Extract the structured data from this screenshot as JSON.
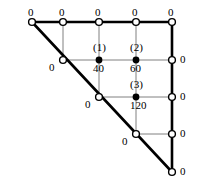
{
  "figure": {
    "width": 197,
    "height": 188,
    "background_color": "#ffffff",
    "line_color": "#000000",
    "interior_line_color": "#808080",
    "boundary_stroke_width": 2.6,
    "interior_stroke_width": 1.0,
    "grid_spacing": 35,
    "origin": {
      "x": 32,
      "y": 22
    }
  },
  "geometry": {
    "shape": "right-triangle",
    "vertices": [
      {
        "name": "top-left",
        "x": 32,
        "y": 22
      },
      {
        "name": "top-right",
        "x": 172,
        "y": 22
      },
      {
        "name": "bottom-right",
        "x": 172,
        "y": 172
      }
    ],
    "hypotenuse": {
      "from": "top-left",
      "to": "bottom-right"
    }
  },
  "boundary_nodes": {
    "top": [
      {
        "id": "T0",
        "x": 32,
        "y": 22,
        "value": "0",
        "label_dx": -4,
        "label_dy": -15
      },
      {
        "id": "T1",
        "x": 63,
        "y": 22,
        "value": "0",
        "label_dx": -4,
        "label_dy": -15
      },
      {
        "id": "T2",
        "x": 99,
        "y": 22,
        "value": "0",
        "label_dx": -4,
        "label_dy": -15
      },
      {
        "id": "T3",
        "x": 136,
        "y": 22,
        "value": "0",
        "label_dx": -4,
        "label_dy": -15
      },
      {
        "id": "T4",
        "x": 172,
        "y": 22,
        "value": "0",
        "label_dx": -4,
        "label_dy": -15
      }
    ],
    "right": [
      {
        "id": "R1",
        "x": 172,
        "y": 60,
        "value": "0",
        "label_dx": 8,
        "label_dy": -6
      },
      {
        "id": "R2",
        "x": 172,
        "y": 97,
        "value": "0",
        "label_dx": 8,
        "label_dy": -6
      },
      {
        "id": "R3",
        "x": 172,
        "y": 134,
        "value": "0",
        "label_dx": 8,
        "label_dy": -6
      },
      {
        "id": "R4",
        "x": 172,
        "y": 172,
        "value": "0",
        "label_dx": 8,
        "label_dy": -6
      }
    ],
    "hypotenuse": [
      {
        "id": "H1",
        "x": 63,
        "y": 60,
        "value": "0",
        "label_dx": -14,
        "label_dy": 2
      },
      {
        "id": "H2",
        "x": 99,
        "y": 97,
        "value": "0",
        "label_dx": -14,
        "label_dy": 2
      },
      {
        "id": "H3",
        "x": 136,
        "y": 134,
        "value": "0",
        "label_dx": -14,
        "label_dy": 2
      }
    ]
  },
  "interior_nodes": [
    {
      "id": "N1",
      "tag": "(1)",
      "value": "40",
      "x": 99,
      "y": 60,
      "tag_dx": -6,
      "tag_dy": -18,
      "value_dx": -6,
      "value_dy": 3
    },
    {
      "id": "N2",
      "tag": "(2)",
      "value": "60",
      "x": 136,
      "y": 60,
      "tag_dx": -6,
      "tag_dy": -18,
      "value_dx": -6,
      "value_dy": 3
    },
    {
      "id": "N3",
      "tag": "(3)",
      "value": "120",
      "x": 136,
      "y": 97,
      "tag_dx": -6,
      "tag_dy": -18,
      "value_dx": -6,
      "value_dy": 3
    }
  ],
  "interior_grid_lines": {
    "vertical": [
      {
        "x": 63,
        "y1": 22,
        "y2": 60
      },
      {
        "x": 99,
        "y1": 22,
        "y2": 97
      },
      {
        "x": 136,
        "y1": 22,
        "y2": 134
      }
    ],
    "horizontal": [
      {
        "y": 60,
        "x1": 63,
        "x2": 172
      },
      {
        "y": 97,
        "x1": 99,
        "x2": 172
      },
      {
        "y": 134,
        "x1": 136,
        "x2": 172
      }
    ]
  },
  "markers": {
    "open_radius": 3.4,
    "open_fill": "#ffffff",
    "open_stroke": "#000000",
    "open_stroke_width": 1.4,
    "filled_radius": 3.4,
    "filled_fill": "#000000"
  }
}
